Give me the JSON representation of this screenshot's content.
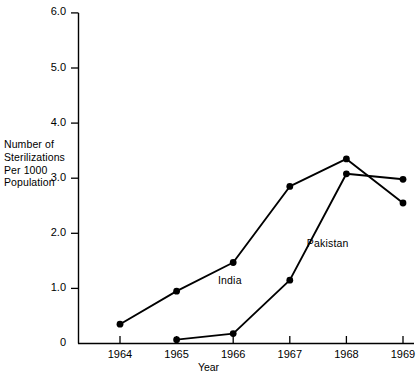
{
  "chart_data": {
    "type": "line",
    "title": "",
    "xlabel": "Year",
    "ylabel": "Number of Sterilizations Per 1000 Population",
    "ylabel_lines": [
      "Number of",
      "Sterilizations",
      "Per 1000",
      "Population"
    ],
    "x": [
      1964,
      1965,
      1966,
      1967,
      1968,
      1969
    ],
    "categories": [
      "1964",
      "1965",
      "1966",
      "1967",
      "1968",
      "1969"
    ],
    "xlim": [
      1963.5,
      1969.5
    ],
    "ylim": [
      0,
      6.0
    ],
    "yticks": [
      "0",
      "1.0",
      "2.0",
      "3.0",
      "4.0",
      "5.0",
      "6.0"
    ],
    "ytick_values": [
      0,
      1.0,
      2.0,
      3.0,
      4.0,
      5.0,
      6.0
    ],
    "grid": false,
    "legend": "inline-annotations",
    "marker": "filled-circle",
    "line_color": "#000000",
    "series": [
      {
        "name": "India",
        "x": [
          1964,
          1965,
          1966,
          1967,
          1968,
          1969
        ],
        "values": [
          0.35,
          0.95,
          1.47,
          2.85,
          3.35,
          2.55
        ]
      },
      {
        "name": "Pakistan",
        "x": [
          1965,
          1966,
          1967,
          1968,
          1969
        ],
        "values": [
          0.07,
          0.18,
          1.15,
          3.08,
          2.98
        ]
      }
    ],
    "annotations": [
      {
        "text": "India",
        "x": 1965.73,
        "y": 1.12
      },
      {
        "text": "Pakistan",
        "x": 1967.3,
        "y": 1.78
      }
    ]
  }
}
